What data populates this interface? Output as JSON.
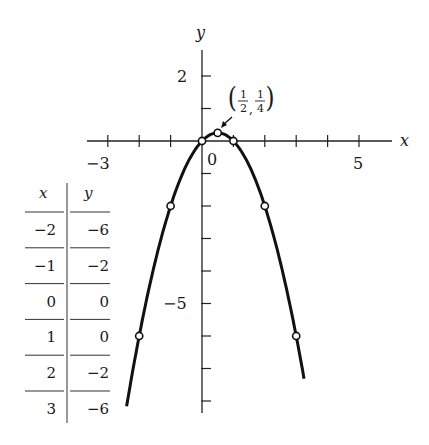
{
  "chart_data": {
    "type": "line",
    "title": "",
    "function": "y = x - x^2",
    "xlabel": "x",
    "ylabel": "y",
    "xlim": [
      -3.5,
      6.2
    ],
    "ylim": [
      -8,
      2.8
    ],
    "x_tick_labels": [
      "-3",
      "0",
      "5"
    ],
    "y_tick_labels": [
      "2",
      "-5"
    ],
    "points": [
      {
        "x": -2,
        "y": -6
      },
      {
        "x": -1,
        "y": -2
      },
      {
        "x": 0,
        "y": 0
      },
      {
        "x": 0.5,
        "y": 0.25
      },
      {
        "x": 1,
        "y": 0
      },
      {
        "x": 2,
        "y": -2
      },
      {
        "x": 3,
        "y": -6
      }
    ],
    "annotation": {
      "label": "(1/2, 1/4)",
      "x": 0.5,
      "y": 0.25
    },
    "grid": false
  },
  "labels": {
    "x_axis": "x",
    "y_axis": "y",
    "tick_neg3": "−3",
    "tick_0": "0",
    "tick_5": "5",
    "tick_2": "2",
    "tick_neg5": "−5",
    "ann_num1": "1",
    "ann_den1": "2",
    "ann_num2": "1",
    "ann_den2": "4"
  },
  "table": {
    "headers": [
      "x",
      "y"
    ],
    "rows": [
      [
        "−2",
        "−6"
      ],
      [
        "−1",
        "−2"
      ],
      [
        "0",
        "0"
      ],
      [
        "1",
        "0"
      ],
      [
        "2",
        "−2"
      ],
      [
        "3",
        "−6"
      ]
    ]
  }
}
